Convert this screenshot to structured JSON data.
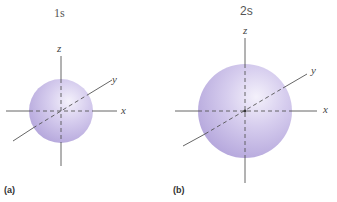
{
  "figure": {
    "panels": [
      {
        "tag": "(a)",
        "title": "1s",
        "orbital": "1s",
        "axes": {
          "x": "x",
          "y": "y",
          "z": "z"
        },
        "sphere_color": "#c9bde6"
      },
      {
        "tag": "(b)",
        "title": "2s",
        "orbital": "2s",
        "axes": {
          "x": "x",
          "y": "y",
          "z": "z"
        },
        "sphere_color": "#c9bde6"
      }
    ]
  }
}
